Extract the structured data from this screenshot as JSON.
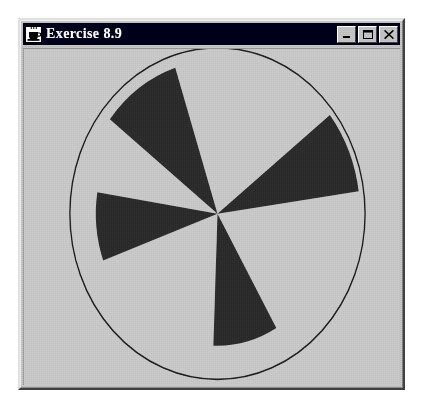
{
  "window": {
    "title": "Exercise 8.9",
    "icon": "java-coffee-cup-icon",
    "background_color": "#c0c0c0",
    "titlebar_color": "#000018",
    "titlebar_text_color": "#ffffff",
    "controls": [
      {
        "name": "minimize",
        "label": "_",
        "glyph": "minimize-icon"
      },
      {
        "name": "maximize",
        "label": "□",
        "glyph": "maximize-icon"
      },
      {
        "name": "close",
        "label": "×",
        "glyph": "close-icon"
      }
    ]
  },
  "canvas": {
    "background_color": "#bfbfbf",
    "outline_color": "#1a1a1a",
    "wedge_color": "#262626",
    "circle": {
      "cx": 194,
      "cy": 147,
      "r": 148
    },
    "description": "pinwheel of four dark wedges inside a thin circle outline"
  },
  "chart_data": {
    "type": "pie",
    "title": "Exercise 8.9",
    "xlabel": "",
    "ylabel": "",
    "center": {
      "x": 194,
      "y": 147
    },
    "outline_radius": 148,
    "fill_color": "#262626",
    "background_color": "#bfbfbf",
    "outline_color": "#1a1a1a",
    "legend": "none",
    "grid": false,
    "wedges": [
      {
        "name": "wedge-upper-left",
        "start_angle_deg": 108,
        "extent_deg": 34,
        "radius": 137
      },
      {
        "name": "wedge-right",
        "start_angle_deg": 8,
        "extent_deg": 30,
        "radius": 143
      },
      {
        "name": "wedge-lower-right",
        "start_angle_deg": -92,
        "extent_deg": 32,
        "radius": 118
      },
      {
        "name": "wedge-left",
        "start_angle_deg": 171,
        "extent_deg": 29,
        "radius": 122
      }
    ]
  }
}
